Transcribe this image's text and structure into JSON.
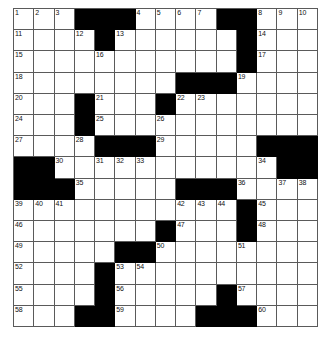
{
  "puzzle": {
    "type": "crossword",
    "rows": 15,
    "columns": 15,
    "cell_colors": {
      "open": "#ffffff",
      "block": "#000000",
      "grid_line": "#5a5a5a",
      "page_background": "#ffffff",
      "number_text": "#111111"
    },
    "numbers_present": [
      1,
      2,
      3,
      4,
      5,
      6,
      7,
      8,
      9,
      10,
      11,
      12,
      13,
      14,
      15,
      16,
      17,
      18,
      19,
      20,
      21,
      22,
      23,
      24,
      25,
      26,
      27,
      28,
      29,
      30,
      31,
      32,
      33,
      34,
      35,
      36,
      37,
      38,
      39,
      40,
      41,
      42,
      43,
      44,
      45,
      46,
      47,
      48,
      49,
      50,
      51,
      52,
      53,
      54,
      55,
      56,
      57,
      58,
      59,
      60
    ],
    "grid": [
      [
        {
          "block": false,
          "num": "1"
        },
        {
          "block": false,
          "num": "2"
        },
        {
          "block": false,
          "num": "3"
        },
        {
          "block": true,
          "num": ""
        },
        {
          "block": true,
          "num": ""
        },
        {
          "block": true,
          "num": ""
        },
        {
          "block": false,
          "num": "4"
        },
        {
          "block": false,
          "num": "5"
        },
        {
          "block": false,
          "num": "6"
        },
        {
          "block": false,
          "num": "7"
        },
        {
          "block": true,
          "num": ""
        },
        {
          "block": true,
          "num": ""
        },
        {
          "block": false,
          "num": "8"
        },
        {
          "block": false,
          "num": "9"
        },
        {
          "block": false,
          "num": "10"
        }
      ],
      [
        {
          "block": false,
          "num": "11"
        },
        {
          "block": false,
          "num": ""
        },
        {
          "block": false,
          "num": ""
        },
        {
          "block": false,
          "num": "12"
        },
        {
          "block": true,
          "num": ""
        },
        {
          "block": false,
          "num": "13"
        },
        {
          "block": false,
          "num": ""
        },
        {
          "block": false,
          "num": ""
        },
        {
          "block": false,
          "num": ""
        },
        {
          "block": false,
          "num": ""
        },
        {
          "block": false,
          "num": ""
        },
        {
          "block": true,
          "num": ""
        },
        {
          "block": false,
          "num": "14"
        },
        {
          "block": false,
          "num": ""
        },
        {
          "block": false,
          "num": ""
        }
      ],
      [
        {
          "block": false,
          "num": "15"
        },
        {
          "block": false,
          "num": ""
        },
        {
          "block": false,
          "num": ""
        },
        {
          "block": false,
          "num": ""
        },
        {
          "block": false,
          "num": "16"
        },
        {
          "block": false,
          "num": ""
        },
        {
          "block": false,
          "num": ""
        },
        {
          "block": false,
          "num": ""
        },
        {
          "block": false,
          "num": ""
        },
        {
          "block": false,
          "num": ""
        },
        {
          "block": false,
          "num": ""
        },
        {
          "block": true,
          "num": ""
        },
        {
          "block": false,
          "num": "17"
        },
        {
          "block": false,
          "num": ""
        },
        {
          "block": false,
          "num": ""
        }
      ],
      [
        {
          "block": false,
          "num": "18"
        },
        {
          "block": false,
          "num": ""
        },
        {
          "block": false,
          "num": ""
        },
        {
          "block": false,
          "num": ""
        },
        {
          "block": false,
          "num": ""
        },
        {
          "block": false,
          "num": ""
        },
        {
          "block": false,
          "num": ""
        },
        {
          "block": false,
          "num": ""
        },
        {
          "block": true,
          "num": ""
        },
        {
          "block": true,
          "num": ""
        },
        {
          "block": true,
          "num": ""
        },
        {
          "block": false,
          "num": "19"
        },
        {
          "block": false,
          "num": ""
        },
        {
          "block": false,
          "num": ""
        },
        {
          "block": false,
          "num": ""
        }
      ],
      [
        {
          "block": false,
          "num": "20"
        },
        {
          "block": false,
          "num": ""
        },
        {
          "block": false,
          "num": ""
        },
        {
          "block": true,
          "num": ""
        },
        {
          "block": false,
          "num": "21"
        },
        {
          "block": false,
          "num": ""
        },
        {
          "block": false,
          "num": ""
        },
        {
          "block": true,
          "num": ""
        },
        {
          "block": false,
          "num": "22"
        },
        {
          "block": false,
          "num": "23"
        },
        {
          "block": false,
          "num": ""
        },
        {
          "block": false,
          "num": ""
        },
        {
          "block": false,
          "num": ""
        },
        {
          "block": false,
          "num": ""
        },
        {
          "block": false,
          "num": ""
        }
      ],
      [
        {
          "block": false,
          "num": "24"
        },
        {
          "block": false,
          "num": ""
        },
        {
          "block": false,
          "num": ""
        },
        {
          "block": true,
          "num": ""
        },
        {
          "block": false,
          "num": "25"
        },
        {
          "block": false,
          "num": ""
        },
        {
          "block": false,
          "num": ""
        },
        {
          "block": false,
          "num": "26"
        },
        {
          "block": false,
          "num": ""
        },
        {
          "block": false,
          "num": ""
        },
        {
          "block": false,
          "num": ""
        },
        {
          "block": false,
          "num": ""
        },
        {
          "block": false,
          "num": ""
        },
        {
          "block": false,
          "num": ""
        },
        {
          "block": false,
          "num": ""
        }
      ],
      [
        {
          "block": false,
          "num": "27"
        },
        {
          "block": false,
          "num": ""
        },
        {
          "block": false,
          "num": ""
        },
        {
          "block": false,
          "num": "28"
        },
        {
          "block": true,
          "num": ""
        },
        {
          "block": true,
          "num": ""
        },
        {
          "block": true,
          "num": ""
        },
        {
          "block": false,
          "num": "29"
        },
        {
          "block": false,
          "num": ""
        },
        {
          "block": false,
          "num": ""
        },
        {
          "block": false,
          "num": ""
        },
        {
          "block": false,
          "num": ""
        },
        {
          "block": true,
          "num": ""
        },
        {
          "block": true,
          "num": ""
        },
        {
          "block": true,
          "num": ""
        }
      ],
      [
        {
          "block": true,
          "num": ""
        },
        {
          "block": true,
          "num": ""
        },
        {
          "block": false,
          "num": "30"
        },
        {
          "block": false,
          "num": ""
        },
        {
          "block": false,
          "num": "31"
        },
        {
          "block": false,
          "num": "32"
        },
        {
          "block": false,
          "num": "33"
        },
        {
          "block": false,
          "num": ""
        },
        {
          "block": false,
          "num": ""
        },
        {
          "block": false,
          "num": ""
        },
        {
          "block": false,
          "num": ""
        },
        {
          "block": false,
          "num": ""
        },
        {
          "block": false,
          "num": "34"
        },
        {
          "block": true,
          "num": ""
        },
        {
          "block": true,
          "num": ""
        }
      ],
      [
        {
          "block": true,
          "num": ""
        },
        {
          "block": true,
          "num": ""
        },
        {
          "block": true,
          "num": ""
        },
        {
          "block": false,
          "num": "35"
        },
        {
          "block": false,
          "num": ""
        },
        {
          "block": false,
          "num": ""
        },
        {
          "block": false,
          "num": ""
        },
        {
          "block": false,
          "num": ""
        },
        {
          "block": true,
          "num": ""
        },
        {
          "block": true,
          "num": ""
        },
        {
          "block": true,
          "num": ""
        },
        {
          "block": false,
          "num": "36"
        },
        {
          "block": false,
          "num": ""
        },
        {
          "block": false,
          "num": "37"
        },
        {
          "block": false,
          "num": "38"
        }
      ],
      [
        {
          "block": false,
          "num": "39"
        },
        {
          "block": false,
          "num": "40"
        },
        {
          "block": false,
          "num": "41"
        },
        {
          "block": false,
          "num": ""
        },
        {
          "block": false,
          "num": ""
        },
        {
          "block": false,
          "num": ""
        },
        {
          "block": false,
          "num": ""
        },
        {
          "block": false,
          "num": ""
        },
        {
          "block": false,
          "num": "42"
        },
        {
          "block": false,
          "num": "43"
        },
        {
          "block": false,
          "num": "44"
        },
        {
          "block": true,
          "num": ""
        },
        {
          "block": false,
          "num": "45"
        },
        {
          "block": false,
          "num": ""
        },
        {
          "block": false,
          "num": ""
        }
      ],
      [
        {
          "block": false,
          "num": "46"
        },
        {
          "block": false,
          "num": ""
        },
        {
          "block": false,
          "num": ""
        },
        {
          "block": false,
          "num": ""
        },
        {
          "block": false,
          "num": ""
        },
        {
          "block": false,
          "num": ""
        },
        {
          "block": false,
          "num": ""
        },
        {
          "block": true,
          "num": ""
        },
        {
          "block": false,
          "num": "47"
        },
        {
          "block": false,
          "num": ""
        },
        {
          "block": false,
          "num": ""
        },
        {
          "block": true,
          "num": ""
        },
        {
          "block": false,
          "num": "48"
        },
        {
          "block": false,
          "num": ""
        },
        {
          "block": false,
          "num": ""
        }
      ],
      [
        {
          "block": false,
          "num": "49"
        },
        {
          "block": false,
          "num": ""
        },
        {
          "block": false,
          "num": ""
        },
        {
          "block": false,
          "num": ""
        },
        {
          "block": false,
          "num": ""
        },
        {
          "block": true,
          "num": ""
        },
        {
          "block": true,
          "num": ""
        },
        {
          "block": false,
          "num": "50"
        },
        {
          "block": false,
          "num": ""
        },
        {
          "block": false,
          "num": ""
        },
        {
          "block": false,
          "num": ""
        },
        {
          "block": false,
          "num": "51"
        },
        {
          "block": false,
          "num": ""
        },
        {
          "block": false,
          "num": ""
        },
        {
          "block": false,
          "num": ""
        }
      ],
      [
        {
          "block": false,
          "num": "52"
        },
        {
          "block": false,
          "num": ""
        },
        {
          "block": false,
          "num": ""
        },
        {
          "block": false,
          "num": ""
        },
        {
          "block": true,
          "num": ""
        },
        {
          "block": false,
          "num": "53"
        },
        {
          "block": false,
          "num": "54"
        },
        {
          "block": false,
          "num": ""
        },
        {
          "block": false,
          "num": ""
        },
        {
          "block": false,
          "num": ""
        },
        {
          "block": false,
          "num": ""
        },
        {
          "block": false,
          "num": ""
        },
        {
          "block": false,
          "num": ""
        },
        {
          "block": false,
          "num": ""
        },
        {
          "block": false,
          "num": ""
        }
      ],
      [
        {
          "block": false,
          "num": "55"
        },
        {
          "block": false,
          "num": ""
        },
        {
          "block": false,
          "num": ""
        },
        {
          "block": false,
          "num": ""
        },
        {
          "block": true,
          "num": ""
        },
        {
          "block": false,
          "num": "56"
        },
        {
          "block": false,
          "num": ""
        },
        {
          "block": false,
          "num": ""
        },
        {
          "block": false,
          "num": ""
        },
        {
          "block": false,
          "num": ""
        },
        {
          "block": true,
          "num": ""
        },
        {
          "block": false,
          "num": "57"
        },
        {
          "block": false,
          "num": ""
        },
        {
          "block": false,
          "num": ""
        },
        {
          "block": false,
          "num": ""
        }
      ],
      [
        {
          "block": false,
          "num": "58"
        },
        {
          "block": false,
          "num": ""
        },
        {
          "block": false,
          "num": ""
        },
        {
          "block": true,
          "num": ""
        },
        {
          "block": true,
          "num": ""
        },
        {
          "block": false,
          "num": "59"
        },
        {
          "block": false,
          "num": ""
        },
        {
          "block": false,
          "num": ""
        },
        {
          "block": false,
          "num": ""
        },
        {
          "block": true,
          "num": ""
        },
        {
          "block": true,
          "num": ""
        },
        {
          "block": true,
          "num": ""
        },
        {
          "block": false,
          "num": "60"
        },
        {
          "block": false,
          "num": ""
        },
        {
          "block": false,
          "num": ""
        }
      ]
    ]
  }
}
